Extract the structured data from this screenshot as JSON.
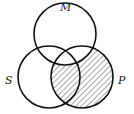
{
  "diagram": {
    "type": "venn-3",
    "labels": {
      "top": "M",
      "left": "S",
      "right": "P"
    },
    "circles": [
      {
        "name": "M",
        "cx": 65,
        "cy": 34,
        "r": 31
      },
      {
        "name": "S",
        "cx": 49,
        "cy": 77,
        "r": 31
      },
      {
        "name": "P",
        "cx": 82,
        "cy": 77,
        "r": 31
      }
    ],
    "shaded_region": "P minus M",
    "stroke_color": "#111111",
    "hatch_color": "#555555"
  }
}
